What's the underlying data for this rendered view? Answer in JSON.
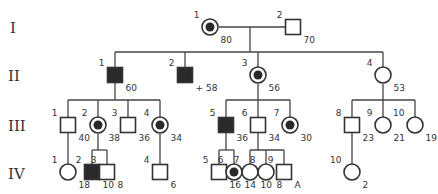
{
  "figure": {
    "type": "pedigree",
    "generations": [
      "I",
      "II",
      "III",
      "IV"
    ]
  },
  "individuals": [
    {
      "id": "I-1",
      "gen": "I",
      "num": "1",
      "sex": "female",
      "status": "carrier-affected",
      "age": "80",
      "x": 210,
      "y": 27
    },
    {
      "id": "I-2",
      "gen": "I",
      "num": "2",
      "sex": "male",
      "status": "unaffected",
      "age": "70",
      "x": 293,
      "y": 27
    },
    {
      "id": "II-1",
      "gen": "II",
      "num": "1",
      "sex": "male",
      "status": "affected",
      "age": "60",
      "x": 115,
      "y": 75
    },
    {
      "id": "II-2",
      "gen": "II",
      "num": "2",
      "sex": "male",
      "status": "affected",
      "age": "+ 58",
      "x": 185,
      "y": 75
    },
    {
      "id": "II-3",
      "gen": "II",
      "num": "3",
      "sex": "female",
      "status": "carrier-affected",
      "age": "56",
      "x": 258,
      "y": 75
    },
    {
      "id": "II-4",
      "gen": "II",
      "num": "4",
      "sex": "female",
      "status": "unaffected",
      "age": "53",
      "x": 383,
      "y": 75
    },
    {
      "id": "III-1",
      "gen": "III",
      "num": "1",
      "sex": "male",
      "status": "unaffected",
      "age": "40",
      "x": 68,
      "y": 125
    },
    {
      "id": "III-2",
      "gen": "III",
      "num": "2",
      "sex": "female",
      "status": "carrier-affected",
      "age": "38",
      "x": 98,
      "y": 125
    },
    {
      "id": "III-3",
      "gen": "III",
      "num": "3",
      "sex": "male",
      "status": "unaffected",
      "age": "36",
      "x": 128,
      "y": 125
    },
    {
      "id": "III-4",
      "gen": "III",
      "num": "4",
      "sex": "female",
      "status": "carrier-affected",
      "age": "34",
      "x": 160,
      "y": 125
    },
    {
      "id": "III-5",
      "gen": "III",
      "num": "5",
      "sex": "male",
      "status": "affected",
      "age": "36",
      "x": 226,
      "y": 125
    },
    {
      "id": "III-6",
      "gen": "III",
      "num": "6",
      "sex": "male",
      "status": "unaffected",
      "age": "34",
      "x": 258,
      "y": 125
    },
    {
      "id": "III-7",
      "gen": "III",
      "num": "7",
      "sex": "female",
      "status": "carrier-affected",
      "age": "30",
      "x": 290,
      "y": 125
    },
    {
      "id": "III-8",
      "gen": "III",
      "num": "8",
      "sex": "male",
      "status": "unaffected",
      "age": "23",
      "x": 352,
      "y": 125
    },
    {
      "id": "III-9",
      "gen": "III",
      "num": "9",
      "sex": "female",
      "status": "unaffected",
      "age": "21",
      "x": 383,
      "y": 125
    },
    {
      "id": "III-10",
      "gen": "III",
      "num": "10",
      "sex": "female",
      "status": "unaffected",
      "age": "19",
      "x": 415,
      "y": 125
    },
    {
      "id": "IV-1",
      "gen": "IV",
      "num": "1",
      "sex": "female",
      "status": "unaffected",
      "age": "18",
      "x": 68,
      "y": 172
    },
    {
      "id": "IV-2",
      "gen": "IV",
      "num": "2",
      "sex": "male",
      "status": "affected",
      "age": "10",
      "x": 92,
      "y": 172
    },
    {
      "id": "IV-3",
      "gen": "IV",
      "num": "3",
      "sex": "male",
      "status": "unaffected",
      "age": "8",
      "x": 107,
      "y": 172
    },
    {
      "id": "IV-4",
      "gen": "IV",
      "num": "4",
      "sex": "male",
      "status": "unaffected",
      "age": "6",
      "x": 160,
      "y": 172
    },
    {
      "id": "IV-5",
      "gen": "IV",
      "num": "5",
      "sex": "male",
      "status": "unaffected",
      "age": "16",
      "x": 219,
      "y": 172
    },
    {
      "id": "IV-6",
      "gen": "IV",
      "num": "6",
      "sex": "female",
      "status": "carrier-affected",
      "age": "14",
      "x": 234,
      "y": 172
    },
    {
      "id": "IV-7",
      "gen": "IV",
      "num": "7",
      "sex": "female",
      "status": "unaffected",
      "age": "10",
      "x": 250,
      "y": 172
    },
    {
      "id": "IV-8",
      "gen": "IV",
      "num": "8",
      "sex": "female",
      "status": "unaffected",
      "age": "8",
      "x": 266,
      "y": 172
    },
    {
      "id": "IV-9",
      "gen": "IV",
      "num": "9",
      "sex": "male",
      "status": "unaffected",
      "age": "A",
      "x": 284,
      "y": 172
    },
    {
      "id": "IV-10",
      "gen": "IV",
      "num": "10",
      "sex": "female",
      "status": "unaffected",
      "age": "2",
      "x": 352,
      "y": 172
    }
  ],
  "lines": [
    [
      219,
      27,
      286,
      27
    ],
    [
      250,
      27,
      250,
      52
    ],
    [
      115,
      52,
      383,
      52
    ],
    [
      115,
      52,
      115,
      67
    ],
    [
      185,
      52,
      185,
      67
    ],
    [
      258,
      52,
      258,
      67
    ],
    [
      383,
      52,
      383,
      67
    ],
    [
      115,
      83,
      115,
      100
    ],
    [
      68,
      100,
      160,
      100
    ],
    [
      68,
      100,
      68,
      118
    ],
    [
      98,
      100,
      98,
      117
    ],
    [
      128,
      100,
      128,
      118
    ],
    [
      160,
      100,
      160,
      117
    ],
    [
      258,
      84,
      258,
      100
    ],
    [
      226,
      100,
      290,
      100
    ],
    [
      226,
      100,
      226,
      118
    ],
    [
      258,
      100,
      258,
      118
    ],
    [
      290,
      100,
      290,
      117
    ],
    [
      383,
      84,
      383,
      100
    ],
    [
      352,
      100,
      415,
      100
    ],
    [
      352,
      100,
      352,
      118
    ],
    [
      383,
      100,
      383,
      117
    ],
    [
      415,
      100,
      415,
      117
    ],
    [
      68,
      132,
      68,
      164
    ],
    [
      98,
      134,
      98,
      150
    ],
    [
      92,
      150,
      107,
      150
    ],
    [
      92,
      150,
      92,
      165
    ],
    [
      107,
      150,
      107,
      165
    ],
    [
      160,
      134,
      160,
      165
    ],
    [
      226,
      132,
      226,
      150
    ],
    [
      219,
      150,
      234,
      150
    ],
    [
      219,
      150,
      219,
      165
    ],
    [
      234,
      150,
      234,
      164
    ],
    [
      258,
      132,
      258,
      150
    ],
    [
      250,
      150,
      284,
      150
    ],
    [
      250,
      150,
      250,
      164
    ],
    [
      266,
      150,
      266,
      164
    ],
    [
      284,
      150,
      284,
      165
    ],
    [
      352,
      132,
      352,
      164
    ]
  ]
}
